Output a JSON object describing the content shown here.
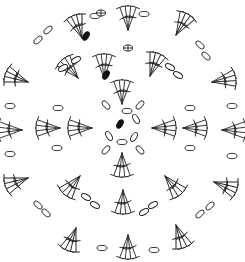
{
  "diagram": {
    "title": "",
    "type": "crochet-chart-round",
    "center": [
      122,
      128
    ],
    "stroke_color": "#222222",
    "background": "#ffffff",
    "legend": {
      "chain": "oval",
      "slip_stitch": "filled-oval",
      "double_crochet_cluster": "fan-of-crossed-posts",
      "magic_ring_mark": "circle-plus"
    },
    "rounds": [
      {
        "round": 1,
        "chains": [
          [
            127,
            111,
            0
          ],
          [
            136,
            119,
            60
          ],
          [
            134,
            137,
            120
          ],
          [
            122,
            142,
            180
          ],
          [
            109,
            136,
            240
          ]
        ],
        "slip_stitch": [
          120,
          124,
          30
        ]
      },
      {
        "round": 2,
        "fans": [
          [
            122,
            104,
            0,
            4
          ],
          [
            152,
            128,
            90,
            4
          ],
          [
            122,
            153,
            180,
            4
          ],
          [
            92,
            128,
            270,
            4
          ]
        ],
        "chains": [
          [
            106,
            105,
            50
          ],
          [
            140,
            105,
            -50
          ],
          [
            140,
            150,
            50
          ],
          [
            106,
            150,
            -50
          ]
        ],
        "markers": [
          [
            128,
            48,
            0
          ]
        ]
      },
      {
        "round": 3,
        "fans": [
          [
            104,
            78,
            0,
            4
          ],
          [
            150,
            76,
            20,
            4
          ],
          [
            183,
            128,
            90,
            4
          ],
          [
            165,
            176,
            140,
            4
          ],
          [
            123,
            190,
            180,
            4
          ],
          [
            80,
            176,
            220,
            4
          ],
          [
            60,
            128,
            270,
            4
          ],
          [
            78,
            78,
            -40,
            4
          ]
        ],
        "chains": [
          [
            76,
            60,
            -30
          ],
          [
            63,
            68,
            -30
          ],
          [
            170,
            67,
            30
          ],
          [
            178,
            75,
            30
          ],
          [
            190,
            108,
            0
          ],
          [
            190,
            148,
            0
          ],
          [
            153,
            205,
            -30
          ],
          [
            144,
            212,
            -30
          ],
          [
            95,
            205,
            30
          ],
          [
            86,
            197,
            30
          ],
          [
            57,
            148,
            0
          ],
          [
            58,
            108,
            0
          ]
        ],
        "slip_stitch": [
          106,
          75,
          30
        ]
      },
      {
        "round": 4,
        "fans": [
          [
            82,
            38,
            -20,
            4
          ],
          [
            128,
            30,
            0,
            4
          ],
          [
            176,
            35,
            30,
            4
          ],
          [
            212,
            82,
            80,
            4
          ],
          [
            222,
            130,
            90,
            4
          ],
          [
            214,
            182,
            110,
            4
          ],
          [
            176,
            225,
            160,
            4
          ],
          [
            128,
            235,
            180,
            4
          ],
          [
            76,
            228,
            200,
            4
          ],
          [
            28,
            178,
            250,
            4
          ],
          [
            22,
            130,
            270,
            4
          ],
          [
            28,
            82,
            290,
            4
          ]
        ],
        "chains": [
          [
            48,
            30,
            -40
          ],
          [
            38,
            40,
            -40
          ],
          [
            95,
            16,
            0
          ],
          [
            144,
            14,
            0
          ],
          [
            200,
            45,
            40
          ],
          [
            206,
            56,
            40
          ],
          [
            232,
            106,
            0
          ],
          [
            232,
            156,
            0
          ],
          [
            210,
            206,
            -40
          ],
          [
            200,
            214,
            -40
          ],
          [
            102,
            248,
            0
          ],
          [
            154,
            250,
            0
          ],
          [
            46,
            213,
            40
          ],
          [
            38,
            205,
            40
          ],
          [
            10,
            154,
            0
          ],
          [
            10,
            106,
            0
          ]
        ],
        "slip_stitch": [
          86,
          36,
          30
        ],
        "markers": [
          [
            101,
            13,
            0
          ]
        ]
      }
    ]
  }
}
